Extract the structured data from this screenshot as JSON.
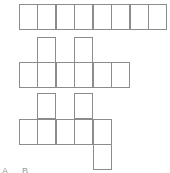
{
  "diagram": {
    "line_color": "#8c8c8c",
    "cell_size": 18.5,
    "figures": [
      {
        "name": "net-1-strip",
        "cells": [
          {
            "x": 19,
            "y": 4,
            "w": 19,
            "h": 26
          },
          {
            "x": 37,
            "y": 4,
            "w": 19,
            "h": 26
          },
          {
            "x": 56,
            "y": 4,
            "w": 19,
            "h": 26
          },
          {
            "x": 74,
            "y": 4,
            "w": 19,
            "h": 26
          },
          {
            "x": 93,
            "y": 4,
            "w": 19,
            "h": 26
          },
          {
            "x": 111,
            "y": 4,
            "w": 19,
            "h": 26
          },
          {
            "x": 130,
            "y": 4,
            "w": 19,
            "h": 26
          },
          {
            "x": 148,
            "y": 4,
            "w": 19,
            "h": 26
          }
        ]
      },
      {
        "name": "net-2",
        "cells": [
          {
            "x": 37,
            "y": 37,
            "w": 19,
            "h": 26
          },
          {
            "x": 74,
            "y": 37,
            "w": 19,
            "h": 26
          },
          {
            "x": 19,
            "y": 62,
            "w": 19,
            "h": 26
          },
          {
            "x": 37,
            "y": 62,
            "w": 19,
            "h": 26
          },
          {
            "x": 56,
            "y": 62,
            "w": 19,
            "h": 26
          },
          {
            "x": 74,
            "y": 62,
            "w": 19,
            "h": 26
          },
          {
            "x": 93,
            "y": 62,
            "w": 19,
            "h": 26
          },
          {
            "x": 111,
            "y": 62,
            "w": 19,
            "h": 26
          }
        ]
      },
      {
        "name": "net-3",
        "cells": [
          {
            "x": 37,
            "y": 93,
            "w": 19,
            "h": 26
          },
          {
            "x": 74,
            "y": 93,
            "w": 19,
            "h": 26
          },
          {
            "x": 19,
            "y": 119,
            "w": 19,
            "h": 26
          },
          {
            "x": 37,
            "y": 119,
            "w": 19,
            "h": 26
          },
          {
            "x": 56,
            "y": 119,
            "w": 19,
            "h": 26
          },
          {
            "x": 74,
            "y": 119,
            "w": 19,
            "h": 26
          },
          {
            "x": 93,
            "y": 119,
            "w": 19,
            "h": 26
          },
          {
            "x": 93,
            "y": 144,
            "w": 19,
            "h": 26
          }
        ]
      }
    ],
    "bottom_labels": "A. B."
  }
}
